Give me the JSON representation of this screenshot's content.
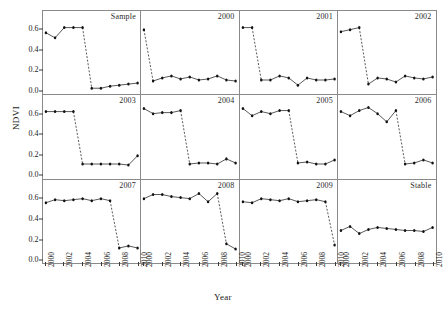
{
  "chart_data": {
    "type": "line",
    "title": "",
    "xlabel": "Year",
    "ylabel": "NDVI",
    "xlim": [
      2000,
      2010
    ],
    "ylim": [
      0.0,
      0.7
    ],
    "yticks": [
      0.0,
      0.2,
      0.4,
      0.6
    ],
    "ytick_labels": [
      "0.0",
      "0.2",
      "0.4",
      "0.6"
    ],
    "xticks": [
      2000,
      2002,
      2004,
      2006,
      2008,
      2010
    ],
    "xtick_labels": [
      "2000",
      "2002",
      "2004",
      "2006",
      "2008",
      "2010"
    ],
    "grid": false,
    "legend": "none",
    "marker": "filled-circle",
    "solid_line_style": "solid",
    "break_line_style": "dashed",
    "layout": {
      "rows": 3,
      "cols": 4
    },
    "panels": [
      {
        "label": "Sample",
        "break_after_index": 4,
        "x": [
          2000,
          2001,
          2002,
          2003,
          2004,
          2005,
          2006,
          2007,
          2008,
          2009,
          2010
        ],
        "y": [
          0.57,
          0.52,
          0.62,
          0.62,
          0.62,
          0.03,
          0.03,
          0.05,
          0.06,
          0.07,
          0.08
        ]
      },
      {
        "label": "2000",
        "break_after_index": 0,
        "x": [
          2000,
          2001,
          2002,
          2003,
          2004,
          2005,
          2006,
          2007,
          2008,
          2009,
          2010
        ],
        "y": [
          0.6,
          0.1,
          0.13,
          0.15,
          0.12,
          0.14,
          0.11,
          0.12,
          0.15,
          0.11,
          0.1
        ]
      },
      {
        "label": "2001",
        "break_after_index": 1,
        "x": [
          2000,
          2001,
          2002,
          2003,
          2004,
          2005,
          2006,
          2007,
          2008,
          2009,
          2010
        ],
        "y": [
          0.62,
          0.62,
          0.11,
          0.11,
          0.15,
          0.13,
          0.06,
          0.13,
          0.11,
          0.11,
          0.12
        ]
      },
      {
        "label": "2002",
        "break_after_index": 2,
        "x": [
          2000,
          2001,
          2002,
          2003,
          2004,
          2005,
          2006,
          2007,
          2008,
          2009,
          2010
        ],
        "y": [
          0.58,
          0.6,
          0.62,
          0.07,
          0.13,
          0.12,
          0.09,
          0.15,
          0.13,
          0.12,
          0.14
        ]
      },
      {
        "label": "2003",
        "break_after_index": 3,
        "x": [
          2000,
          2001,
          2002,
          2003,
          2004,
          2005,
          2006,
          2007,
          2008,
          2009,
          2010
        ],
        "y": [
          0.62,
          0.62,
          0.62,
          0.62,
          0.11,
          0.11,
          0.11,
          0.11,
          0.11,
          0.1,
          0.19
        ]
      },
      {
        "label": "2004",
        "break_after_index": 4,
        "x": [
          2000,
          2001,
          2002,
          2003,
          2004,
          2005,
          2006,
          2007,
          2008,
          2009,
          2010
        ],
        "y": [
          0.65,
          0.6,
          0.61,
          0.61,
          0.63,
          0.11,
          0.12,
          0.12,
          0.11,
          0.16,
          0.12
        ]
      },
      {
        "label": "2005",
        "break_after_index": 5,
        "x": [
          2000,
          2001,
          2002,
          2003,
          2004,
          2005,
          2006,
          2007,
          2008,
          2009,
          2010
        ],
        "y": [
          0.65,
          0.58,
          0.62,
          0.6,
          0.63,
          0.63,
          0.12,
          0.13,
          0.11,
          0.11,
          0.15
        ]
      },
      {
        "label": "2006",
        "break_after_index": 6,
        "x": [
          2000,
          2001,
          2002,
          2003,
          2004,
          2005,
          2006,
          2007,
          2008,
          2009,
          2010
        ],
        "y": [
          0.62,
          0.58,
          0.63,
          0.66,
          0.6,
          0.52,
          0.63,
          0.11,
          0.12,
          0.15,
          0.12
        ]
      },
      {
        "label": "2007",
        "break_after_index": 7,
        "x": [
          2000,
          2001,
          2002,
          2003,
          2004,
          2005,
          2006,
          2007,
          2008,
          2009,
          2010
        ],
        "y": [
          0.56,
          0.59,
          0.58,
          0.59,
          0.6,
          0.58,
          0.6,
          0.58,
          0.12,
          0.14,
          0.12
        ]
      },
      {
        "label": "2008",
        "break_after_index": 8,
        "x": [
          2000,
          2001,
          2002,
          2003,
          2004,
          2005,
          2006,
          2007,
          2008,
          2009,
          2010
        ],
        "y": [
          0.6,
          0.64,
          0.64,
          0.62,
          0.61,
          0.6,
          0.65,
          0.57,
          0.65,
          0.16,
          0.11
        ]
      },
      {
        "label": "2009",
        "break_after_index": 9,
        "x": [
          2000,
          2001,
          2002,
          2003,
          2004,
          2005,
          2006,
          2007,
          2008,
          2009,
          2010
        ],
        "y": [
          0.57,
          0.56,
          0.6,
          0.59,
          0.58,
          0.6,
          0.57,
          0.58,
          0.59,
          0.57,
          0.15
        ]
      },
      {
        "label": "Stable",
        "break_after_index": -1,
        "x": [
          2000,
          2001,
          2002,
          2003,
          2004,
          2005,
          2006,
          2007,
          2008,
          2009,
          2010
        ],
        "y": [
          0.29,
          0.33,
          0.26,
          0.3,
          0.32,
          0.31,
          0.3,
          0.29,
          0.29,
          0.28,
          0.32
        ]
      }
    ]
  }
}
